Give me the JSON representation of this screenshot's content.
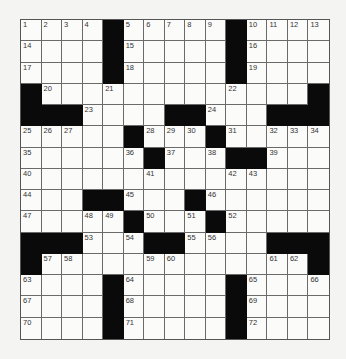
{
  "puzzle": {
    "rows": 15,
    "cols": 15,
    "layout": [
      "....#.....#....",
      "....#.....#....",
      "....#.....#....",
      "#.............#",
      "###....##...###",
      ".....#...#.....",
      "......#...##...",
      "...............",
      "...##...#......",
      ".....#...#.....",
      "###...##....###",
      "#.............#",
      "....#.....#....",
      "....#.....#....",
      "....#.....#...."
    ],
    "numbers": [
      [
        0,
        0,
        1
      ],
      [
        0,
        1,
        2
      ],
      [
        0,
        2,
        3
      ],
      [
        0,
        3,
        4
      ],
      [
        0,
        5,
        5
      ],
      [
        0,
        6,
        6
      ],
      [
        0,
        7,
        7
      ],
      [
        0,
        8,
        8
      ],
      [
        0,
        9,
        9
      ],
      [
        0,
        11,
        10
      ],
      [
        0,
        12,
        11
      ],
      [
        0,
        13,
        12
      ],
      [
        0,
        14,
        13
      ],
      [
        1,
        0,
        14
      ],
      [
        1,
        5,
        15
      ],
      [
        1,
        11,
        16
      ],
      [
        2,
        0,
        17
      ],
      [
        2,
        5,
        18
      ],
      [
        2,
        11,
        19
      ],
      [
        3,
        1,
        20
      ],
      [
        3,
        4,
        21
      ],
      [
        3,
        10,
        22
      ],
      [
        4,
        3,
        23
      ],
      [
        4,
        9,
        24
      ],
      [
        5,
        0,
        25
      ],
      [
        5,
        1,
        26
      ],
      [
        5,
        2,
        27
      ],
      [
        5,
        6,
        28
      ],
      [
        5,
        7,
        29
      ],
      [
        5,
        8,
        30
      ],
      [
        5,
        10,
        31
      ],
      [
        5,
        12,
        32
      ],
      [
        5,
        13,
        33
      ],
      [
        5,
        14,
        34
      ],
      [
        6,
        0,
        35
      ],
      [
        6,
        5,
        36
      ],
      [
        6,
        7,
        37
      ],
      [
        6,
        9,
        38
      ],
      [
        6,
        12,
        39
      ],
      [
        7,
        0,
        40
      ],
      [
        7,
        6,
        41
      ],
      [
        7,
        10,
        42
      ],
      [
        7,
        11,
        43
      ],
      [
        8,
        0,
        44
      ],
      [
        8,
        5,
        45
      ],
      [
        8,
        9,
        46
      ],
      [
        9,
        0,
        47
      ],
      [
        9,
        3,
        48
      ],
      [
        9,
        4,
        49
      ],
      [
        9,
        6,
        50
      ],
      [
        9,
        8,
        51
      ],
      [
        9,
        10,
        52
      ],
      [
        10,
        3,
        53
      ],
      [
        10,
        5,
        54
      ],
      [
        10,
        8,
        55
      ],
      [
        10,
        9,
        56
      ],
      [
        11,
        1,
        57
      ],
      [
        11,
        2,
        58
      ],
      [
        11,
        6,
        59
      ],
      [
        11,
        7,
        60
      ],
      [
        11,
        12,
        61
      ],
      [
        11,
        13,
        62
      ],
      [
        12,
        0,
        63
      ],
      [
        12,
        5,
        64
      ],
      [
        12,
        11,
        65
      ],
      [
        12,
        14,
        66
      ],
      [
        13,
        0,
        67
      ],
      [
        13,
        5,
        68
      ],
      [
        13,
        11,
        69
      ],
      [
        14,
        0,
        70
      ],
      [
        14,
        5,
        71
      ],
      [
        14,
        11,
        72
      ]
    ]
  },
  "colors": {
    "black_square": "#0a0a0a",
    "white_square": "#fbfbfa",
    "grid_line": "#6a6a6a",
    "background": "#f4f4f2"
  }
}
